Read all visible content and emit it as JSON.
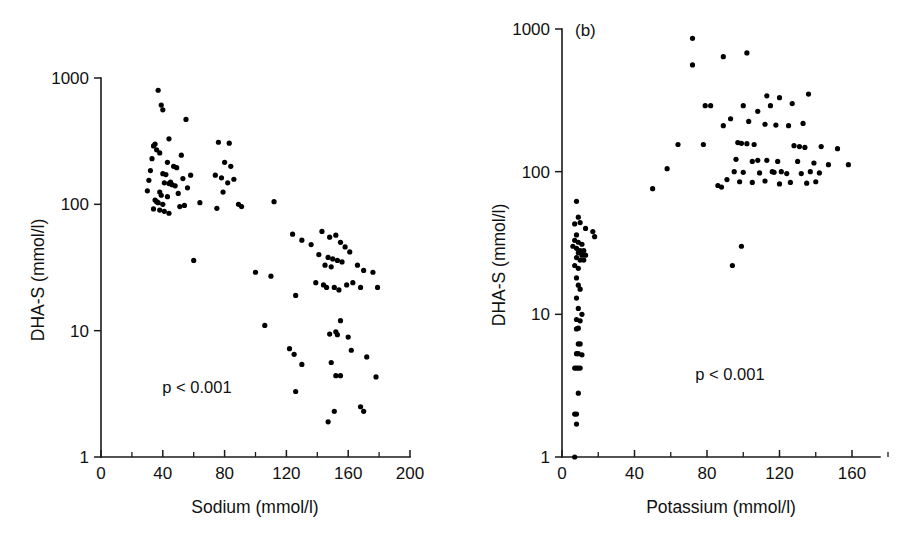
{
  "figure": {
    "background": "#ffffff",
    "point_color": "#000000",
    "axis_color": "#1a1a1a",
    "width": 909,
    "height": 550
  },
  "chart_data": [
    {
      "type": "scatter",
      "panel_label": "",
      "title": "",
      "xlabel": "Sodium (mmol/l)",
      "ylabel": "DHA-S (mmol/l)",
      "xlim": [
        0,
        200
      ],
      "ylim": [
        1,
        1000
      ],
      "yscale": "log",
      "xscale": "linear",
      "grid": false,
      "legend": null,
      "annotation": "p < 0.001",
      "annotation_x": 62,
      "annotation_y": 3.4,
      "xticks": [
        0,
        40,
        80,
        120,
        160,
        200
      ],
      "xticklabels": [
        "0",
        "40",
        "80",
        "120",
        "160",
        "200"
      ],
      "xminorticks": [
        20,
        60,
        100,
        140,
        180
      ],
      "yticks": [
        1,
        10,
        100,
        1000
      ],
      "yticklabels": [
        "1",
        "10",
        "100",
        "1000"
      ],
      "points": [
        [
          37,
          800
        ],
        [
          39,
          610
        ],
        [
          40,
          560
        ],
        [
          55,
          470
        ],
        [
          44,
          330
        ],
        [
          35,
          300
        ],
        [
          34,
          290
        ],
        [
          36,
          270
        ],
        [
          38,
          255
        ],
        [
          52,
          245
        ],
        [
          33,
          230
        ],
        [
          43,
          215
        ],
        [
          47,
          200
        ],
        [
          49,
          195
        ],
        [
          32,
          185
        ],
        [
          40,
          175
        ],
        [
          42,
          172
        ],
        [
          58,
          170
        ],
        [
          53,
          160
        ],
        [
          31,
          155
        ],
        [
          45,
          150
        ],
        [
          41,
          148
        ],
        [
          44,
          146
        ],
        [
          46,
          143
        ],
        [
          48,
          140
        ],
        [
          56,
          135
        ],
        [
          30,
          128
        ],
        [
          38,
          125
        ],
        [
          50,
          122
        ],
        [
          39,
          118
        ],
        [
          43,
          115
        ],
        [
          35,
          108
        ],
        [
          36,
          105
        ],
        [
          37,
          103
        ],
        [
          40,
          100
        ],
        [
          54,
          98
        ],
        [
          51,
          96
        ],
        [
          34,
          92
        ],
        [
          38,
          90
        ],
        [
          41,
          88
        ],
        [
          44,
          85
        ],
        [
          76,
          310
        ],
        [
          83,
          305
        ],
        [
          80,
          215
        ],
        [
          84,
          200
        ],
        [
          74,
          170
        ],
        [
          78,
          162
        ],
        [
          86,
          158
        ],
        [
          82,
          148
        ],
        [
          79,
          125
        ],
        [
          64,
          103
        ],
        [
          89,
          100
        ],
        [
          91,
          96
        ],
        [
          75,
          93
        ],
        [
          112,
          105
        ],
        [
          60,
          36
        ],
        [
          100,
          29
        ],
        [
          110,
          27
        ],
        [
          124,
          58
        ],
        [
          130,
          52
        ],
        [
          136,
          48
        ],
        [
          143,
          61
        ],
        [
          148,
          55
        ],
        [
          152,
          57
        ],
        [
          155,
          50
        ],
        [
          158,
          46
        ],
        [
          141,
          40
        ],
        [
          147,
          38
        ],
        [
          150,
          37
        ],
        [
          153,
          36
        ],
        [
          145,
          33
        ],
        [
          149,
          32
        ],
        [
          156,
          35
        ],
        [
          161,
          42
        ],
        [
          166,
          33
        ],
        [
          170,
          30
        ],
        [
          176,
          29
        ],
        [
          179,
          22
        ],
        [
          139,
          24
        ],
        [
          144,
          23
        ],
        [
          146,
          22
        ],
        [
          151,
          22
        ],
        [
          154,
          21
        ],
        [
          159,
          23
        ],
        [
          163,
          24
        ],
        [
          168,
          22
        ],
        [
          126,
          19
        ],
        [
          106,
          11
        ],
        [
          122,
          7.2
        ],
        [
          125,
          6.5
        ],
        [
          130,
          5.4
        ],
        [
          148,
          9.4
        ],
        [
          152,
          9.8
        ],
        [
          153,
          9.3
        ],
        [
          155,
          12
        ],
        [
          160,
          8.9
        ],
        [
          162,
          7.0
        ],
        [
          149,
          5.6
        ],
        [
          172,
          6.2
        ],
        [
          152,
          4.4
        ],
        [
          155,
          4.4
        ],
        [
          178,
          4.3
        ],
        [
          126,
          3.3
        ],
        [
          168,
          2.5
        ],
        [
          151,
          2.3
        ],
        [
          170,
          2.3
        ],
        [
          147,
          1.9
        ]
      ]
    },
    {
      "type": "scatter",
      "panel_label": "(b)",
      "title": "",
      "xlabel": "Potassium (mmol/l)",
      "ylabel": "DHA-S (mmol/l)",
      "xlim": [
        0,
        176
      ],
      "ylim": [
        1,
        1000
      ],
      "yscale": "log",
      "xscale": "linear",
      "grid": false,
      "legend": null,
      "annotation": "p < 0.001",
      "annotation_x": 98,
      "annotation_y": 5.5,
      "xticks": [
        0,
        40,
        80,
        120,
        160
      ],
      "xticklabels": [
        "0",
        "40",
        "80",
        "120",
        "160"
      ],
      "xminorticks": [
        20,
        60,
        100,
        140
      ],
      "yticks": [
        1,
        10,
        100,
        1000
      ],
      "yticklabels": [
        "1",
        "10",
        "100",
        "1000"
      ],
      "points": [
        [
          72,
          860
        ],
        [
          72,
          560
        ],
        [
          89,
          640
        ],
        [
          102,
          680
        ],
        [
          113,
          340
        ],
        [
          120,
          330
        ],
        [
          136,
          350
        ],
        [
          127,
          300
        ],
        [
          79,
          290
        ],
        [
          82,
          290
        ],
        [
          100,
          290
        ],
        [
          115,
          290
        ],
        [
          108,
          265
        ],
        [
          93,
          235
        ],
        [
          103,
          225
        ],
        [
          112,
          215
        ],
        [
          118,
          212
        ],
        [
          133,
          218
        ],
        [
          125,
          210
        ],
        [
          89,
          210
        ],
        [
          64,
          155
        ],
        [
          78,
          155
        ],
        [
          97,
          160
        ],
        [
          99,
          158
        ],
        [
          102,
          157
        ],
        [
          106,
          155
        ],
        [
          128,
          152
        ],
        [
          131,
          150
        ],
        [
          134,
          148
        ],
        [
          143,
          150
        ],
        [
          152,
          145
        ],
        [
          96,
          122
        ],
        [
          105,
          118
        ],
        [
          108,
          120
        ],
        [
          113,
          120
        ],
        [
          119,
          118
        ],
        [
          130,
          118
        ],
        [
          139,
          115
        ],
        [
          147,
          112
        ],
        [
          158,
          112
        ],
        [
          58,
          105
        ],
        [
          95,
          100
        ],
        [
          100,
          99
        ],
        [
          109,
          98
        ],
        [
          116,
          100
        ],
        [
          117,
          99
        ],
        [
          121,
          100
        ],
        [
          124,
          97
        ],
        [
          132,
          97
        ],
        [
          137,
          100
        ],
        [
          142,
          98
        ],
        [
          91,
          88
        ],
        [
          98,
          85
        ],
        [
          105,
          84
        ],
        [
          112,
          86
        ],
        [
          120,
          82
        ],
        [
          126,
          84
        ],
        [
          135,
          83
        ],
        [
          140,
          85
        ],
        [
          88,
          78
        ],
        [
          50,
          76
        ],
        [
          86,
          80
        ],
        [
          99,
          30
        ],
        [
          94,
          22
        ],
        [
          8,
          62
        ],
        [
          9,
          48
        ],
        [
          7,
          43
        ],
        [
          10,
          44
        ],
        [
          13,
          40
        ],
        [
          17,
          38
        ],
        [
          18,
          35
        ],
        [
          8,
          36
        ],
        [
          7,
          33
        ],
        [
          9,
          32
        ],
        [
          11,
          31
        ],
        [
          6,
          30
        ],
        [
          8,
          29
        ],
        [
          10,
          28
        ],
        [
          12,
          28
        ],
        [
          9,
          27
        ],
        [
          11,
          26
        ],
        [
          13,
          26
        ],
        [
          8,
          25
        ],
        [
          10,
          24
        ],
        [
          12,
          24
        ],
        [
          7,
          22
        ],
        [
          9,
          21
        ],
        [
          8,
          18
        ],
        [
          9,
          16
        ],
        [
          10,
          15
        ],
        [
          8,
          13
        ],
        [
          9,
          11
        ],
        [
          11,
          10
        ],
        [
          8,
          9.2
        ],
        [
          10,
          9.0
        ],
        [
          9,
          8.0
        ],
        [
          8,
          7.9
        ],
        [
          9,
          6.2
        ],
        [
          10,
          6.2
        ],
        [
          8,
          5.3
        ],
        [
          9,
          5.3
        ],
        [
          11,
          5.2
        ],
        [
          7,
          4.2
        ],
        [
          8,
          4.2
        ],
        [
          9,
          4.2
        ],
        [
          10,
          4.2
        ],
        [
          9,
          2.8
        ],
        [
          7,
          2.0
        ],
        [
          8,
          2.0
        ],
        [
          8,
          1.7
        ],
        [
          7,
          1.0
        ]
      ]
    }
  ]
}
